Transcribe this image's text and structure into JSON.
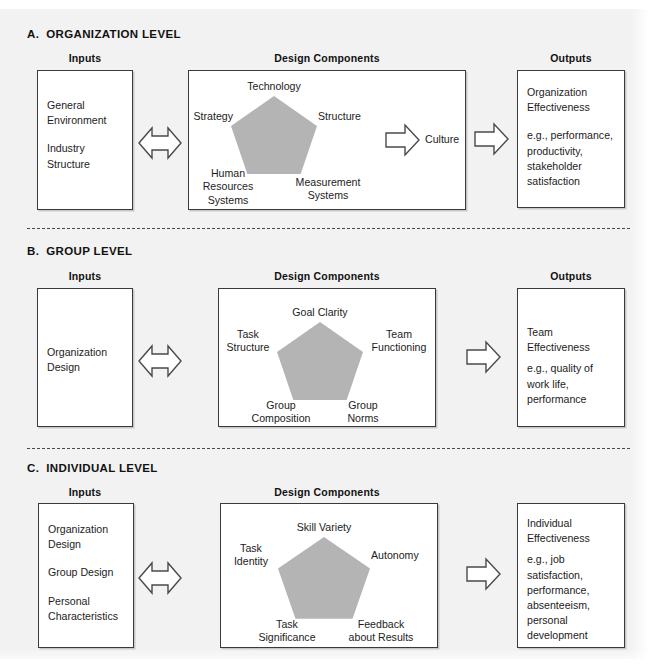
{
  "figure": {
    "background_color": "#f2f2f2",
    "pentagon_color": "#b4b4b4",
    "border_color": "#3a3a3a"
  },
  "column_headers": {
    "inputs": "Inputs",
    "design_components": "Design Components",
    "outputs": "Outputs"
  },
  "sections": [
    {
      "id": "organization",
      "title": "A.  ORGANIZATION LEVEL",
      "headers": {
        "inputs": "Inputs",
        "design": "Design Components",
        "outputs": "Outputs"
      },
      "inputs": [
        "General\nEnvironment",
        "Industry\nStructure"
      ],
      "pentagon_nodes": {
        "top": "Technology",
        "left": "Strategy",
        "right": "Structure",
        "bottom_left": "Human\nResources\nSystems",
        "bottom_right": "Measurement\nSystems"
      },
      "extra_label": "Culture",
      "outputs": [
        "Organization\nEffectiveness",
        "e.g., performance,\nproductivity,\nstakeholder\nsatisfaction"
      ]
    },
    {
      "id": "group",
      "title": "B.  GROUP LEVEL",
      "headers": {
        "inputs": "Inputs",
        "design": "Design Components",
        "outputs": "Outputs"
      },
      "inputs": [
        "Organization\nDesign"
      ],
      "pentagon_nodes": {
        "top": "Goal Clarity",
        "left": "Task\nStructure",
        "right": "Team\nFunctioning",
        "bottom_left": "Group\nComposition",
        "bottom_right": "Group\nNorms"
      },
      "extra_label": "",
      "outputs": [
        "Team\nEffectiveness",
        "e.g., quality of\nwork life,\nperformance"
      ]
    },
    {
      "id": "individual",
      "title": "C.  INDIVIDUAL LEVEL",
      "headers": {
        "inputs": "Inputs",
        "design": "Design Components",
        "outputs": ""
      },
      "inputs": [
        "Organization\nDesign",
        "Group Design",
        "Personal\nCharacteristics"
      ],
      "pentagon_nodes": {
        "top": "Skill Variety",
        "left": "Task\nIdentity",
        "right": "Autonomy",
        "bottom_left": "Task\nSignificance",
        "bottom_right": "Feedback\nabout Results"
      },
      "extra_label": "",
      "outputs": [
        "Individual\nEffectiveness",
        "e.g., job\nsatisfaction,\nperformance,\nabsenteeism,\npersonal\ndevelopment"
      ]
    }
  ],
  "icons": {
    "double_arrow": "double-headed-arrow",
    "right_arrow": "right-arrow"
  }
}
